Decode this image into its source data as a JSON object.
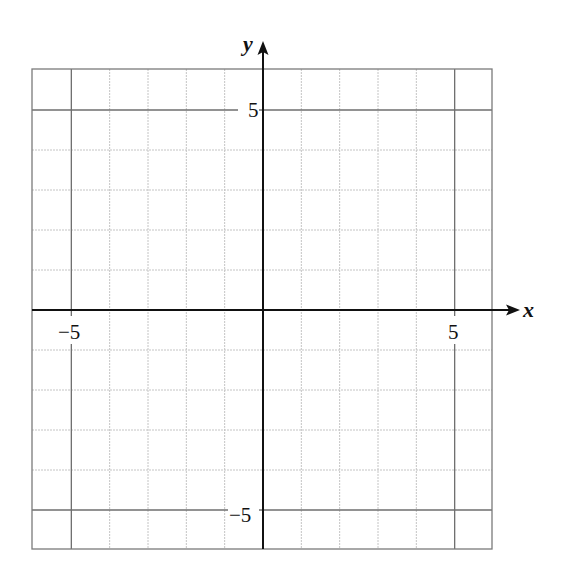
{
  "chart_data": {
    "type": "scatter",
    "title": "",
    "xlabel": "x",
    "ylabel": "y",
    "xlim": [
      -6,
      6
    ],
    "ylim": [
      -6,
      6
    ],
    "grid": true,
    "grid_step": 1,
    "major_lines": [
      -5,
      5
    ],
    "x_ticks": [
      {
        "value": -5,
        "label": "−5"
      },
      {
        "value": 5,
        "label": "5"
      }
    ],
    "y_ticks": [
      {
        "value": 5,
        "label": "5"
      },
      {
        "value": -5,
        "label": "−5"
      }
    ],
    "series": [],
    "legend": null
  },
  "colors": {
    "axis": "#111111",
    "minor_grid": "#c4c4c4",
    "major_grid": "#6e6e6e",
    "border": "#7a7a7a"
  },
  "labels": {
    "x_axis": "x",
    "y_axis": "y",
    "x_tick_neg5": "−5",
    "x_tick_pos5": "5",
    "y_tick_pos5": "5",
    "y_tick_neg5": "−5"
  }
}
